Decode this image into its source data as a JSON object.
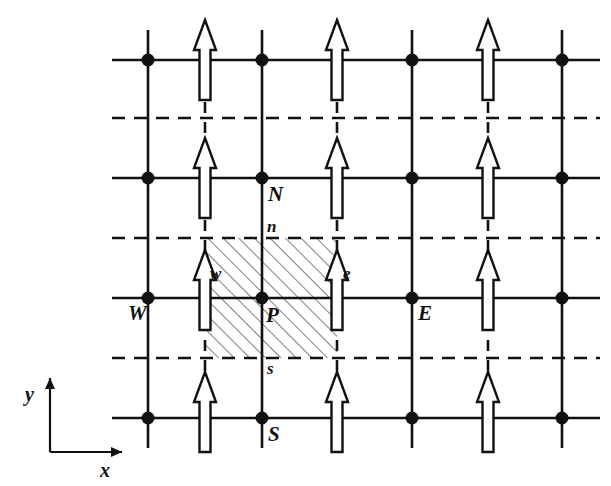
{
  "figure": {
    "type": "staggered-grid-control-volume-diagram",
    "background": "#ffffff",
    "ink_color": "#111111",
    "width": 611,
    "height": 486
  },
  "axes": {
    "x_label": "x",
    "y_label": "y",
    "origin": {
      "x": 50,
      "y": 452
    },
    "x_arrow_end": {
      "x": 122,
      "y": 452
    },
    "y_arrow_end": {
      "x": 50,
      "y": 378
    }
  },
  "grid": {
    "node_columns_x": [
      148,
      262,
      412,
      562
    ],
    "node_rows_y": [
      60,
      178,
      298,
      418
    ],
    "face_columns_x": [
      205,
      337,
      488
    ],
    "dashed_rows_y": [
      118,
      238,
      358
    ],
    "solid_row_x_start": 112,
    "solid_row_x_end": 600,
    "solid_col_y_start": 30,
    "solid_col_y_end": 448,
    "dashed_row_x_start": 112,
    "dashed_row_x_end": 600,
    "node_radius": 6.5,
    "line_width": 2.6,
    "dash_pattern": "13 9"
  },
  "arrows": {
    "description": "hollow upward velocity arrows at staggered v-faces",
    "shaft_half_width": 5.5,
    "head_half_width": 11,
    "head_height": 30,
    "total_height": 80,
    "fill": "#ffffff",
    "stroke": "#111111",
    "stroke_width": 2.4,
    "positions": [
      {
        "x": 205,
        "base_y": 100
      },
      {
        "x": 337,
        "base_y": 100
      },
      {
        "x": 488,
        "base_y": 100
      },
      {
        "x": 205,
        "base_y": 218
      },
      {
        "x": 337,
        "base_y": 218
      },
      {
        "x": 488,
        "base_y": 218
      },
      {
        "x": 205,
        "base_y": 330
      },
      {
        "x": 337,
        "base_y": 330
      },
      {
        "x": 488,
        "base_y": 330
      },
      {
        "x": 205,
        "base_y": 452
      },
      {
        "x": 337,
        "base_y": 452
      },
      {
        "x": 488,
        "base_y": 452
      }
    ]
  },
  "control_volume": {
    "label": "hatched control volume around P",
    "x": 205,
    "y": 238,
    "width": 132,
    "height": 120,
    "hatch_angle_deg": -45,
    "hatch_spacing": 11,
    "hatch_stroke": "#555555",
    "hatch_width": 1.5
  },
  "labels": {
    "node_N": "N",
    "node_S": "S",
    "node_E": "E",
    "node_W": "W",
    "node_P": "P",
    "face_n": "n",
    "face_s": "s",
    "face_e": "e",
    "face_w": "w",
    "positions": {
      "N": {
        "x": 268,
        "y": 184
      },
      "S": {
        "x": 268,
        "y": 424
      },
      "E": {
        "x": 418,
        "y": 303
      },
      "W": {
        "x": 128,
        "y": 303
      },
      "P": {
        "x": 266,
        "y": 305
      },
      "n": {
        "x": 267,
        "y": 218
      },
      "s": {
        "x": 267,
        "y": 360
      },
      "e": {
        "x": 343,
        "y": 265
      },
      "w": {
        "x": 210,
        "y": 265
      }
    }
  }
}
